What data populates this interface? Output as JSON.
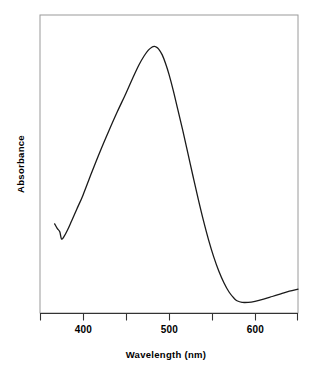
{
  "figure": {
    "background_color": "#ffffff",
    "line_color": "#1a1a1a",
    "frame_color": "#9a9a9a",
    "axis_color": "#333333"
  },
  "chart_data": {
    "type": "line",
    "title": "",
    "xlabel": "Wavelength (nm)",
    "ylabel": "Absorbance",
    "xlim": [
      350,
      650
    ],
    "ylim": [
      0,
      1.12
    ],
    "grid": false,
    "legend": null,
    "x_ticks_major": [
      400,
      500,
      600
    ],
    "x_tick_labels": [
      "400",
      "500",
      "600"
    ],
    "x_ticks_minor": [
      350,
      450,
      550,
      650
    ],
    "y_ticks": [],
    "y_tick_labels": [],
    "series": [
      {
        "name": "Absorbance spectrum",
        "x": [
          367,
          370,
          373,
          375,
          378,
          382,
          387,
          393,
          400,
          410,
          420,
          430,
          440,
          450,
          458,
          465,
          471,
          476,
          480,
          483,
          485,
          488,
          492,
          496,
          500,
          505,
          510,
          516,
          522,
          528,
          534,
          540,
          546,
          552,
          558,
          564,
          570,
          576,
          579,
          585,
          592,
          600,
          610,
          620,
          630,
          640,
          650
        ],
        "y": [
          0.335,
          0.318,
          0.305,
          0.278,
          0.288,
          0.312,
          0.348,
          0.392,
          0.443,
          0.527,
          0.608,
          0.684,
          0.757,
          0.826,
          0.884,
          0.932,
          0.966,
          0.988,
          0.999,
          1.002,
          1.0,
          0.992,
          0.971,
          0.938,
          0.897,
          0.836,
          0.768,
          0.686,
          0.6,
          0.513,
          0.428,
          0.348,
          0.275,
          0.211,
          0.157,
          0.113,
          0.078,
          0.054,
          0.046,
          0.04,
          0.04,
          0.044,
          0.052,
          0.062,
          0.072,
          0.082,
          0.09
        ]
      }
    ]
  },
  "axes": {
    "x_axis_label": "Wavelength (nm)",
    "y_axis_label": "Absorbance",
    "x_tick_400": "400",
    "x_tick_500": "500",
    "x_tick_600": "600"
  }
}
